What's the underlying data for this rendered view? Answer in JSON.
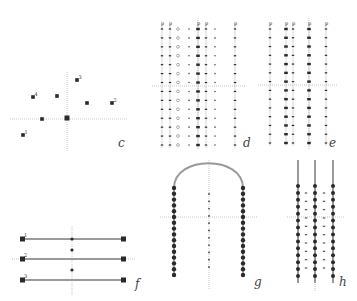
{
  "figure": {
    "width": 357,
    "height": 301,
    "colors": {
      "ink": "#2a2a2a",
      "rod": "#9a9a9a",
      "axis": "#b8b8b8",
      "label": "#444444"
    }
  },
  "panels": {
    "c": {
      "label": "c",
      "label_pos": [
        120,
        146
      ],
      "axes": {
        "h": [
          10,
          119,
          127,
          119
        ],
        "v": [
          67,
          72,
          67,
          152
        ]
      },
      "points": [
        {
          "x": 23,
          "y": 135,
          "tag": "1"
        },
        {
          "x": 33,
          "y": 97,
          "tag": "4"
        },
        {
          "x": 57,
          "y": 96,
          "tag": ""
        },
        {
          "x": 77,
          "y": 80,
          "tag": "3"
        },
        {
          "x": 87,
          "y": 103,
          "tag": ""
        },
        {
          "x": 112,
          "y": 103,
          "tag": "2"
        },
        {
          "x": 42,
          "y": 119,
          "tag": ""
        },
        {
          "x": 67,
          "y": 118,
          "tag": ""
        }
      ]
    },
    "d": {
      "label": "d",
      "label_pos": [
        244,
        146
      ],
      "axes": {
        "h": [
          152,
          86,
          246,
          86
        ],
        "v": [
          198,
          18,
          198,
          150
        ]
      },
      "rows": {
        "y0": 29,
        "y1": 145,
        "count": 14
      },
      "columns": [
        {
          "x": 162,
          "style": "bar",
          "tag": "p"
        },
        {
          "x": 170,
          "style": "bar",
          "tag": "p"
        },
        {
          "x": 178,
          "style": "ring",
          "tag": ""
        },
        {
          "x": 189,
          "style": "dot",
          "tag": ""
        },
        {
          "x": 198,
          "style": "barbold",
          "tag": "p"
        },
        {
          "x": 206,
          "style": "bar",
          "tag": "p"
        },
        {
          "x": 215,
          "style": "dot",
          "tag": ""
        },
        {
          "x": 235,
          "style": "bar",
          "tag": "p"
        }
      ]
    },
    "e": {
      "label": "e",
      "label_pos": [
        330,
        146
      ],
      "axes": {
        "h": [
          258,
          85,
          338,
          85
        ],
        "v": [
          309,
          18,
          309,
          150
        ]
      },
      "rows": {
        "y0": 29,
        "y1": 143,
        "count": 14
      },
      "columns": [
        {
          "x": 270,
          "style": "bar",
          "tag": "p"
        },
        {
          "x": 286,
          "style": "barbold",
          "tag": "p"
        },
        {
          "x": 293,
          "style": "bar",
          "tag": "p"
        },
        {
          "x": 309,
          "style": "barbold",
          "tag": "p"
        },
        {
          "x": 326,
          "style": "bar",
          "tag": "p"
        }
      ]
    },
    "f": {
      "label": "f",
      "label_pos": [
        136,
        287
      ],
      "axes": {
        "h": [
          12,
          259,
          135,
          259
        ],
        "v": [
          72,
          226,
          72,
          295
        ]
      },
      "bars": [
        {
          "y": 239,
          "x0": 23,
          "x1": 123,
          "tag": "1"
        },
        {
          "y": 259,
          "x0": 23,
          "x1": 123,
          "tag": "2"
        },
        {
          "y": 280,
          "x0": 23,
          "x1": 123,
          "tag": "3"
        }
      ],
      "center_dots": [
        {
          "x": 72,
          "y": 250
        },
        {
          "x": 72,
          "y": 270
        },
        {
          "x": 72,
          "y": 239
        }
      ]
    },
    "g": {
      "label": "g",
      "label_pos": [
        255,
        285
      ],
      "axes": {
        "h": [
          160,
          217,
          258,
          217
        ],
        "v": [
          209,
          160,
          209,
          290
        ]
      },
      "arch": {
        "cx": 209,
        "top": 161,
        "left": 174,
        "right": 243,
        "base": 188
      },
      "left_column": {
        "x": 174,
        "y0": 188,
        "y1": 275,
        "count": 16
      },
      "right_column": {
        "x": 243,
        "y0": 188,
        "y1": 275,
        "count": 16
      },
      "center_column": {
        "x": 209,
        "y0": 194,
        "y1": 267,
        "count": 11
      }
    },
    "h": {
      "label": "h",
      "label_pos": [
        340,
        285
      ],
      "axes": {
        "h": [
          287,
          217,
          345,
          217
        ],
        "v": [
          315,
          160,
          315,
          292
        ]
      },
      "rods": [
        {
          "x": 298,
          "y0": 160,
          "y1": 283
        },
        {
          "x": 315,
          "y0": 160,
          "y1": 283
        },
        {
          "x": 333,
          "y0": 160,
          "y1": 283
        }
      ],
      "beads": {
        "y0": 186,
        "y1": 276,
        "count": 14
      },
      "between": [
        {
          "x": 306
        },
        {
          "x": 324
        }
      ],
      "between_rows": {
        "y0": 193,
        "y1": 268,
        "count": 10
      }
    }
  }
}
